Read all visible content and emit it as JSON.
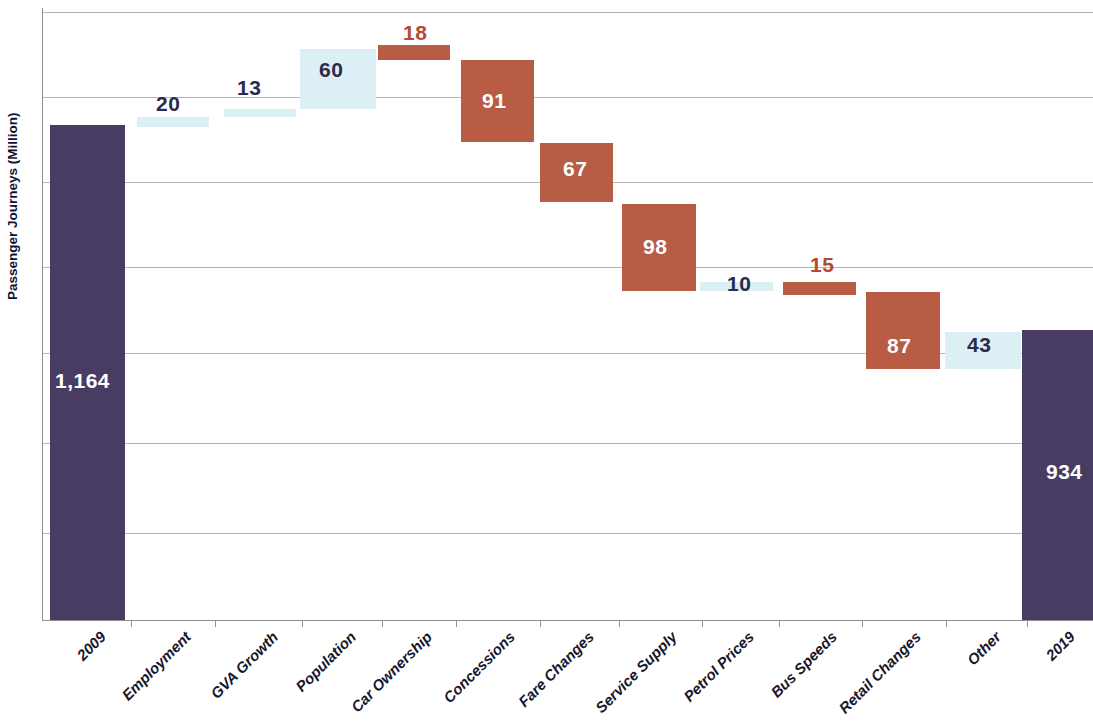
{
  "chart_data": {
    "type": "bar",
    "subtype": "waterfall",
    "title": "",
    "xlabel": "",
    "ylabel": "Passenger Journeys (Million)",
    "ylim": [
      0,
      1270
    ],
    "grid": true,
    "legend": null,
    "categories": [
      "2009",
      "Employment",
      "GVA Growth",
      "Population",
      "Car Ownership",
      "Concessions",
      "Fare Changes",
      "Service Supply",
      "Petrol Prices",
      "Bus Speeds",
      "Retail Changes",
      "Other",
      "2019"
    ],
    "values": [
      1164,
      20,
      13,
      60,
      18,
      91,
      67,
      98,
      10,
      15,
      87,
      43,
      934
    ],
    "value_labels": [
      "1,164",
      "20",
      "13",
      "60",
      "18",
      "91",
      "67",
      "98",
      "10",
      "15",
      "87",
      "43",
      "934"
    ],
    "kinds": [
      "total",
      "up",
      "up",
      "up",
      "down",
      "down",
      "down",
      "down",
      "up",
      "down",
      "down",
      "up",
      "total"
    ],
    "colors": {
      "total": "#493C62",
      "decrease": "#B85C46",
      "increase": "#DCEFF4",
      "gridline": "#9b9b9b",
      "label_dark": "#2b2b4a",
      "label_red": "#B04A35",
      "label_white": "#ffffff"
    },
    "bars": [
      {
        "category": "2009",
        "label": "1,164",
        "kind": "total",
        "x": 50,
        "w": 75,
        "top": 125,
        "bottom": 620,
        "label_x": 55,
        "label_y": 369,
        "label_style": "white"
      },
      {
        "category": "Employment",
        "label": "20",
        "kind": "up",
        "x": 137,
        "w": 72,
        "top": 117,
        "bottom": 127,
        "label_x": 156,
        "label_y": 92,
        "label_style": "dark"
      },
      {
        "category": "GVA Growth",
        "label": "13",
        "kind": "up",
        "x": 224,
        "w": 72,
        "top": 109,
        "bottom": 117,
        "label_x": 237,
        "label_y": 76,
        "label_style": "dark"
      },
      {
        "category": "Population",
        "label": "60",
        "kind": "up",
        "x": 300,
        "w": 76,
        "top": 49,
        "bottom": 109,
        "label_x": 319,
        "label_y": 58,
        "label_style": "dark"
      },
      {
        "category": "Car Ownership",
        "label": "18",
        "kind": "down",
        "x": 378,
        "w": 72,
        "top": 45,
        "bottom": 60,
        "label_x": 403,
        "label_y": 21,
        "label_style": "red"
      },
      {
        "category": "Concessions",
        "label": "91",
        "kind": "down",
        "x": 461,
        "w": 73,
        "top": 60,
        "bottom": 142,
        "label_x": 482,
        "label_y": 89,
        "label_style": "white"
      },
      {
        "category": "Fare Changes",
        "label": "67",
        "kind": "down",
        "x": 540,
        "w": 73,
        "top": 143,
        "bottom": 202,
        "label_x": 563,
        "label_y": 157,
        "label_style": "white"
      },
      {
        "category": "Service Supply",
        "label": "98",
        "kind": "down",
        "x": 622,
        "w": 74,
        "top": 204,
        "bottom": 291,
        "label_x": 643,
        "label_y": 235,
        "label_style": "white"
      },
      {
        "category": "Petrol Prices",
        "label": "10",
        "kind": "up",
        "x": 700,
        "w": 73,
        "top": 282,
        "bottom": 291,
        "label_x": 727,
        "label_y": 272,
        "label_style": "dark"
      },
      {
        "category": "Bus Speeds",
        "label": "15",
        "kind": "down",
        "x": 783,
        "w": 73,
        "top": 282,
        "bottom": 295,
        "label_x": 810,
        "label_y": 253,
        "label_style": "red"
      },
      {
        "category": "Retail Changes",
        "label": "87",
        "kind": "down",
        "x": 866,
        "w": 74,
        "top": 292,
        "bottom": 369,
        "label_x": 887,
        "label_y": 334,
        "label_style": "white"
      },
      {
        "category": "Other",
        "label": "43",
        "kind": "up",
        "x": 945,
        "w": 76,
        "top": 332,
        "bottom": 369,
        "label_x": 967,
        "label_y": 333,
        "label_style": "dark"
      },
      {
        "category": "2019",
        "label": "934",
        "kind": "total",
        "x": 1022,
        "w": 71,
        "top": 330,
        "bottom": 620,
        "label_x": 1046,
        "label_y": 460,
        "label_style": "white"
      }
    ],
    "gridlines_y": [
      12,
      97,
      182,
      267,
      353,
      443,
      533,
      620
    ]
  }
}
